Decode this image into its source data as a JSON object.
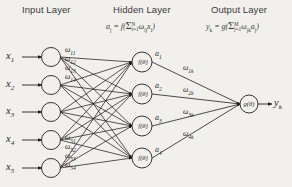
{
  "figure": {
    "background_color": "#f2f0ec",
    "stroke_color": "#1f1f1f"
  },
  "layers": {
    "input": {
      "title": "Input Layer",
      "node_count": 5,
      "node_labels": [
        "x",
        "x",
        "x",
        "x",
        "x"
      ],
      "node_subscripts": [
        "1",
        "2",
        "3",
        "4",
        "5"
      ]
    },
    "hidden": {
      "title": "Hidden Layer",
      "node_count": 4,
      "node_function": "f(θ)",
      "formula": {
        "lhs": "a",
        "lhs_sub": "j",
        "eq": " = f( ",
        "fn": "f",
        "sigma": "Σ",
        "sigma_upper": "N",
        "sigma_lower": "i=1",
        "term": "ω",
        "term_sub": "ij",
        "term2": "x",
        "term2_sub": "i",
        "close": " )"
      },
      "activation_labels": [
        "a",
        "a",
        "a",
        "a"
      ],
      "activation_subscripts": [
        "1",
        "2",
        "3",
        "4"
      ]
    },
    "output": {
      "title": "Output Layer",
      "node_count": 1,
      "node_function": "g(θ)",
      "formula": {
        "lhs": "y",
        "lhs_sub": "k",
        "fn": "g",
        "sigma": "Σ",
        "sigma_upper": "M",
        "sigma_lower": "j=1",
        "term": "ω",
        "term_sub": "jk",
        "term2": "a",
        "term2_sub": "j"
      },
      "output_label": "y",
      "output_subscript": "k"
    }
  },
  "weights": {
    "input_to_hidden_top": [
      {
        "symbol": "ω",
        "sub": "11"
      },
      {
        "symbol": "ω",
        "sub": "12"
      },
      {
        "symbol": "ω",
        "sub": "13"
      },
      {
        "symbol": "ω",
        "sub": "14"
      }
    ],
    "input_to_hidden_bottom": [
      {
        "symbol": "ω",
        "sub": "51"
      },
      {
        "symbol": "ω",
        "sub": "52"
      },
      {
        "symbol": "ω",
        "sub": "53"
      },
      {
        "symbol": "ω",
        "sub": "54"
      }
    ],
    "hidden_to_output": [
      {
        "symbol": "ω",
        "sub": "1k"
      },
      {
        "symbol": "ω",
        "sub": "2k"
      },
      {
        "symbol": "ω",
        "sub": "3k"
      },
      {
        "symbol": "ω",
        "sub": "4k"
      }
    ]
  }
}
